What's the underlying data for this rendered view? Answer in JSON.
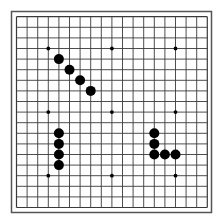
{
  "board": {
    "size": 19,
    "colors": {
      "background": "#ffffff",
      "grid_line": "#3a3a3a",
      "frame": "#555555",
      "stone_black": "#000000",
      "star_point": "#000000"
    },
    "star_points": [
      [
        3,
        3
      ],
      [
        9,
        3
      ],
      [
        15,
        3
      ],
      [
        3,
        9
      ],
      [
        9,
        9
      ],
      [
        15,
        9
      ],
      [
        3,
        15
      ],
      [
        9,
        15
      ],
      [
        15,
        15
      ]
    ],
    "stones": [
      {
        "color": "black",
        "col": 4,
        "row": 4
      },
      {
        "color": "black",
        "col": 5,
        "row": 5
      },
      {
        "color": "black",
        "col": 6,
        "row": 6
      },
      {
        "color": "black",
        "col": 7,
        "row": 7
      },
      {
        "color": "black",
        "col": 4,
        "row": 11
      },
      {
        "color": "black",
        "col": 4,
        "row": 12
      },
      {
        "color": "black",
        "col": 4,
        "row": 13
      },
      {
        "color": "black",
        "col": 4,
        "row": 14
      },
      {
        "color": "black",
        "col": 13,
        "row": 11
      },
      {
        "color": "black",
        "col": 13,
        "row": 12
      },
      {
        "color": "black",
        "col": 13,
        "row": 13
      },
      {
        "color": "black",
        "col": 14,
        "row": 13
      },
      {
        "color": "black",
        "col": 15,
        "row": 13
      }
    ]
  }
}
